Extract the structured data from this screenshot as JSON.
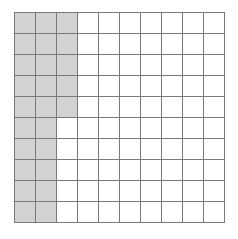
{
  "figure": {
    "background_color": "#ffffff"
  },
  "grid": {
    "columns": 10,
    "rows": 10,
    "cell_size_px": 21,
    "origin_x_px": 14,
    "origin_y_px": 12,
    "line_color": "#7a7a7a",
    "line_width_px": 1,
    "cell_fill_color": "#ffffff",
    "shaded_fill_color": "#d2d2d2",
    "shaded_cell_count": 25,
    "total_cell_count": 100,
    "shaded_region_shape": "L-shaped",
    "shaded_columns_full": [
      1,
      2
    ],
    "shaded_column_partial": 3,
    "shaded_column_partial_rows": 5,
    "shaded_row_lengths": [
      3,
      3,
      3,
      3,
      3,
      2,
      2,
      2,
      2,
      2
    ],
    "shaded_matrix": [
      [
        1,
        1,
        1,
        0,
        0,
        0,
        0,
        0,
        0,
        0
      ],
      [
        1,
        1,
        1,
        0,
        0,
        0,
        0,
        0,
        0,
        0
      ],
      [
        1,
        1,
        1,
        0,
        0,
        0,
        0,
        0,
        0,
        0
      ],
      [
        1,
        1,
        1,
        0,
        0,
        0,
        0,
        0,
        0,
        0
      ],
      [
        1,
        1,
        1,
        0,
        0,
        0,
        0,
        0,
        0,
        0
      ],
      [
        1,
        1,
        0,
        0,
        0,
        0,
        0,
        0,
        0,
        0
      ],
      [
        1,
        1,
        0,
        0,
        0,
        0,
        0,
        0,
        0,
        0
      ],
      [
        1,
        1,
        0,
        0,
        0,
        0,
        0,
        0,
        0,
        0
      ],
      [
        1,
        1,
        0,
        0,
        0,
        0,
        0,
        0,
        0,
        0
      ],
      [
        1,
        1,
        0,
        0,
        0,
        0,
        0,
        0,
        0,
        0
      ]
    ]
  }
}
